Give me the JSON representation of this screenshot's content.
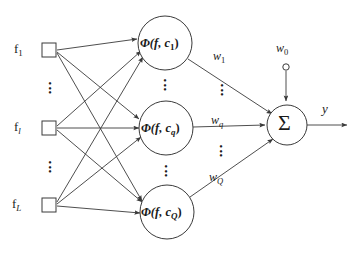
{
  "diagram": {
    "colors": {
      "line": "#3a3a3a",
      "text": "#1a1a1a",
      "background": "#ffffff",
      "node_fill": "#ffffff"
    },
    "inputs": [
      {
        "id": "input-1",
        "label": "f",
        "subscript": "1",
        "sub_style": "roman",
        "x": 49,
        "y": 50
      },
      {
        "id": "input-l",
        "label": "f",
        "subscript": "l",
        "sub_style": "italic",
        "x": 49,
        "y": 128
      },
      {
        "id": "input-L",
        "label": "f",
        "subscript": "L",
        "sub_style": "italic",
        "x": 49,
        "y": 205
      }
    ],
    "input_ellipsis": [
      "⋮",
      "⋮"
    ],
    "hidden_nodes": [
      {
        "id": "hidden-1",
        "text": "Φ(f, c",
        "subscript": "1",
        "sub_style": "roman",
        "close": ")",
        "cx": 165,
        "cy": 43,
        "r": 27
      },
      {
        "id": "hidden-q",
        "text": "Φ(f, c",
        "subscript": "q",
        "sub_style": "italic",
        "close": ")",
        "cx": 166,
        "cy": 128,
        "r": 27
      },
      {
        "id": "hidden-Q",
        "text": "Φ(f, c",
        "subscript": "Q",
        "sub_style": "italic",
        "close": ")",
        "cx": 167,
        "cy": 212,
        "r": 27
      }
    ],
    "hidden_ellipsis": [
      "⋮",
      "⋮"
    ],
    "weights": [
      {
        "id": "weight-1",
        "label": "w",
        "subscript": "1",
        "sub_style": "roman",
        "x": 213,
        "y": 57
      },
      {
        "id": "weight-q",
        "label": "w",
        "subscript": "q",
        "sub_style": "italic",
        "x": 213,
        "y": 121
      },
      {
        "id": "weight-Q",
        "label": "w",
        "subscript": "Q",
        "sub_style": "italic",
        "x": 213,
        "y": 178
      }
    ],
    "weight_ellipsis": [
      "⋮",
      "⋮"
    ],
    "bias": {
      "id": "bias-w0",
      "label": "w",
      "subscript": "0",
      "sub_style": "roman",
      "x": 279,
      "y": 48,
      "circle_cx": 286,
      "circle_cy": 67,
      "circle_r": 3.2
    },
    "sum_node": {
      "id": "sum-node",
      "symbol": "Σ",
      "cx": 287,
      "cy": 125,
      "r": 20
    },
    "output": {
      "id": "output-y",
      "label": "y",
      "x": 322,
      "y": 107,
      "line_x1": 307,
      "line_x2": 347,
      "line_y": 125
    }
  }
}
